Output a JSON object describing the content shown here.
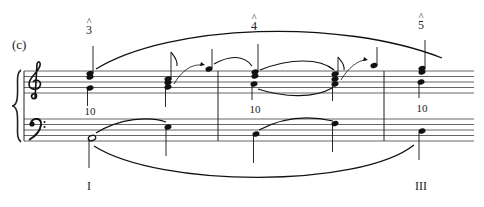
{
  "figure": {
    "part_label": "(c)",
    "scale_degrees": [
      {
        "caret": "^",
        "number": "3"
      },
      {
        "caret": "^",
        "number": "4"
      },
      {
        "caret": "^",
        "number": "5"
      }
    ],
    "interval_figures": [
      "10",
      "10",
      "10"
    ],
    "roman_numerals": [
      "I",
      "III"
    ],
    "clefs": {
      "upper": "treble",
      "lower": "bass"
    },
    "colors": {
      "ink": "#1a1a1a",
      "background": "#ffffff"
    }
  }
}
